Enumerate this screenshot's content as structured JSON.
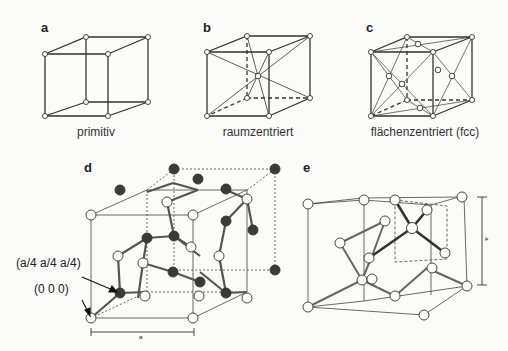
{
  "panels": {
    "a": {
      "letter": "a",
      "caption": "primitiv"
    },
    "b": {
      "letter": "b",
      "caption": "raumzentriert"
    },
    "c": {
      "letter": "c",
      "caption": "flächenzentriert (fcc)"
    },
    "d": {
      "letter": "d",
      "annotation_1": "(a/4 a/4 a/4)",
      "annotation_2": "(0 0 0)",
      "dimension_label": "a"
    },
    "e": {
      "letter": "e",
      "dimension_label": "a"
    }
  },
  "colors": {
    "line": "#333333",
    "atom_dark": "#3a3a3a",
    "atom_light": "#ffffff"
  }
}
